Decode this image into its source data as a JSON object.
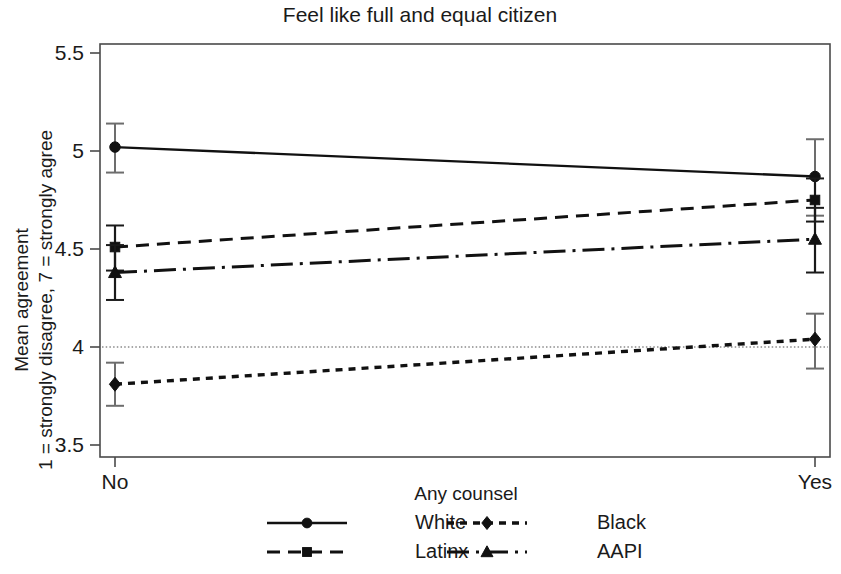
{
  "chart_data": {
    "type": "line",
    "title": "Feel like full and equal citizen",
    "xlabel": "Any counsel",
    "ylabel_line1": "Mean agreement",
    "ylabel_line2": "1 = strongly disagree, 7 = strongly agree",
    "categories": [
      "No",
      "Yes"
    ],
    "ylim": [
      3.5,
      5.5
    ],
    "yticks": [
      "5.5",
      "5",
      "4.5",
      "4",
      "3.5"
    ],
    "ytick_values": [
      5.5,
      5,
      4.5,
      4,
      3.5
    ],
    "grid": false,
    "reference_line": 4.0,
    "legend_position": "bottom",
    "series": [
      {
        "name": "White",
        "marker": "circle",
        "linestyle": "solid",
        "values": [
          5.02,
          4.87
        ],
        "ci_low": [
          4.89,
          4.67
        ],
        "ci_high": [
          5.14,
          5.06
        ]
      },
      {
        "name": "Black",
        "marker": "diamond",
        "linestyle": "dotted",
        "values": [
          3.81,
          4.04
        ],
        "ci_low": [
          3.7,
          3.89
        ],
        "ci_high": [
          3.92,
          4.17
        ]
      },
      {
        "name": "Latinx",
        "marker": "square",
        "linestyle": "dashed",
        "values": [
          4.51,
          4.75
        ],
        "ci_low": [
          4.39,
          4.64
        ],
        "ci_high": [
          4.62,
          4.86
        ]
      },
      {
        "name": "AAPI",
        "marker": "triangle",
        "linestyle": "dashdot",
        "values": [
          4.38,
          4.55
        ],
        "ci_low": [
          4.24,
          4.38
        ],
        "ci_high": [
          4.52,
          4.71
        ]
      }
    ]
  },
  "legend": {
    "entries": [
      {
        "label": "White"
      },
      {
        "label": "Black"
      },
      {
        "label": "Latinx"
      },
      {
        "label": "AAPI"
      }
    ]
  },
  "colors": {
    "ink": "#111111",
    "frame": "#4a4a4a",
    "errorbar": "#6d6d6d",
    "background": "#ffffff"
  }
}
